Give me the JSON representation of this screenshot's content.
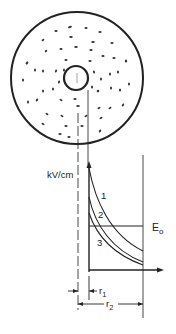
{
  "diagram": {
    "axis": {
      "y_label": "kV/cm"
    },
    "curves": [
      {
        "label": "1"
      },
      {
        "label": "2"
      },
      {
        "label": "3"
      }
    ],
    "threshold": {
      "label": "E",
      "subscript": "o"
    },
    "dimensions": {
      "r1": {
        "label": "r",
        "subscript": "1"
      },
      "r2": {
        "label": "r",
        "subscript": "2"
      }
    },
    "colors": {
      "ink": "#222222",
      "background": "#ffffff"
    }
  }
}
